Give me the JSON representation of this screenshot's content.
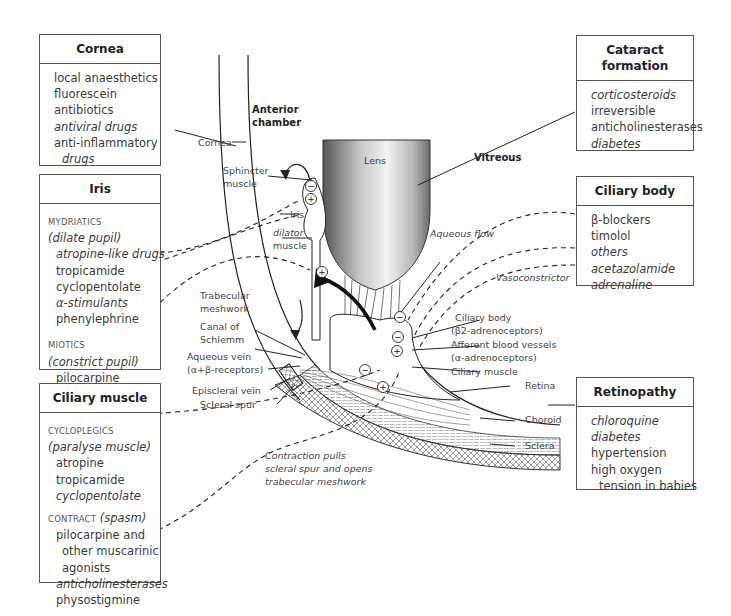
{
  "boxes": {
    "cornea": {
      "title": "Cornea",
      "items": [
        "local anaesthetics",
        "fluorescein",
        "antibiotics",
        "antiviral drugs",
        "anti-inflammatory",
        "drugs"
      ]
    },
    "iris": {
      "title": "Iris",
      "mydriatics_caption": "MYDRIATICS",
      "mydriatics_sub": "(dilate pupil)",
      "mydriatics_items": [
        "atropine-like drugs",
        "tropicamide",
        "cyclopentolate",
        "α-stimulants",
        "phenylephrine"
      ],
      "miotics_caption": "MIOTICS",
      "miotics_sub": "(constrict pupil)",
      "miotics_items": [
        "pilocarpine"
      ]
    },
    "ciliary_muscle": {
      "title": "Ciliary muscle",
      "cycloplegics_caption": "CYCLOPLEGICS",
      "cycloplegics_sub": "(paralyse muscle)",
      "cycloplegics_items": [
        "atropine",
        "tropicamide",
        "cyclopentolate"
      ],
      "contract_caption": "CONTRACT",
      "contract_sub": "(spasm)",
      "contract_items": [
        "pilocarpine and",
        "other muscarinic",
        "agonists",
        "anticholinesterases",
        "physostigmine"
      ]
    },
    "cataract": {
      "title_line1": "Cataract",
      "title_line2": "formation",
      "items": [
        "corticosteroids",
        "irreversible",
        "anticholinesterases",
        "diabetes"
      ]
    },
    "ciliary_body": {
      "title": "Ciliary body",
      "items": [
        "β-blockers",
        "timolol",
        "others",
        "acetazolamide",
        "adrenaline"
      ]
    },
    "retinopathy": {
      "title": "Retinopathy",
      "items": [
        "chloroquine",
        "diabetes",
        "hypertension",
        "high oxygen",
        "tension in babies"
      ]
    }
  },
  "diagram_labels": {
    "anterior_chamber_1": "Anterior",
    "anterior_chamber_2": "chamber",
    "cornea": "Cornea",
    "lens": "Lens",
    "vitreous": "Vitreous",
    "sphincter_1": "Sphincter",
    "sphincter_2": "muscle",
    "iris": "Iris",
    "dilator_1": "dilator",
    "dilator_2": "muscle",
    "aqueous_flow": "Aqueous flow",
    "vasoconstrictor": "Vasoconstrictor",
    "trabecular_1": "Trabecular",
    "trabecular_2": "meshwork",
    "canal_1": "Canal of",
    "canal_2": "Schlemm",
    "aqueous_vein_1": "Aqueous vein",
    "aqueous_vein_2": "(α+β-receptors)",
    "episcleral_vein": "Episcleral vein",
    "scleral_spur": "Scleral spur",
    "ciliary_body_1": "Ciliary body",
    "ciliary_body_2": "(β2-adrenoceptors)",
    "afferent_1": "Afferent blood vessels",
    "afferent_2": "(α-adrenoceptors)",
    "ciliary_muscle": "Ciliary muscle",
    "retina": "Retina",
    "choroid": "Choroid",
    "sclera": "Sclera",
    "contraction_1": "Contraction pulls",
    "contraction_2": "scleral spur and opens",
    "contraction_3": "trabecular meshwork"
  },
  "symbols": {
    "minus": "−",
    "plus": "+",
    "beta2": "β2"
  },
  "colors": {
    "line": "#222222",
    "box_border": "#555555",
    "text": "#3a3a3a"
  }
}
